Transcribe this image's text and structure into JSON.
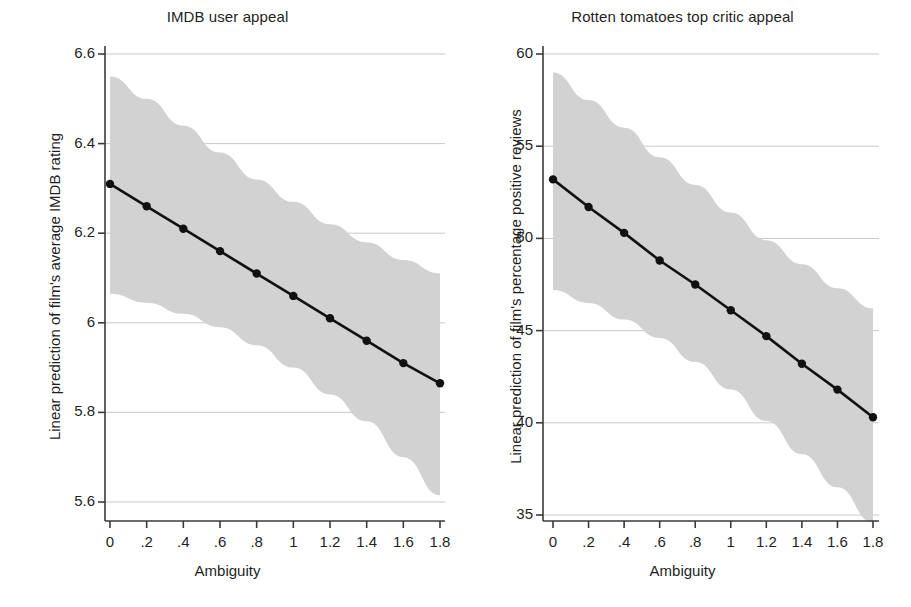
{
  "figure": {
    "width": 911,
    "height": 607,
    "background": "#ffffff",
    "panel_count": 2
  },
  "style": {
    "line_color": "#111111",
    "marker_color": "#111111",
    "band_color": "#d2d2d2",
    "grid_color": "#c9c9c9",
    "axis_color": "#3a3a3a",
    "text_color": "#1f1f1f"
  },
  "chart_data": [
    {
      "type": "line",
      "panel": "left",
      "title": "IMDB user appeal",
      "xlabel": "Ambiguity",
      "ylabel": "Linear prediction of film's average IMDB rating",
      "x": [
        0,
        0.2,
        0.4,
        0.6,
        0.8,
        1,
        1.2,
        1.4,
        1.6,
        1.8
      ],
      "values": [
        6.31,
        6.26,
        6.21,
        6.16,
        6.11,
        6.06,
        6.01,
        5.96,
        5.91,
        5.865
      ],
      "ci_upper": [
        6.55,
        6.5,
        6.44,
        6.38,
        6.32,
        6.27,
        6.22,
        6.18,
        6.14,
        6.11
      ],
      "ci_lower": [
        6.065,
        6.045,
        6.02,
        5.99,
        5.95,
        5.9,
        5.84,
        5.78,
        5.7,
        5.615
      ],
      "xlim": [
        0,
        1.8
      ],
      "ylim": [
        5.6,
        6.6
      ],
      "xticks": [
        0,
        0.2,
        0.4,
        0.6,
        0.8,
        1,
        1.2,
        1.4,
        1.6,
        1.8
      ],
      "xtick_labels": [
        "0",
        ".2",
        ".4",
        ".6",
        ".8",
        "1",
        "1.2",
        "1.4",
        "1.6",
        "1.8"
      ],
      "yticks": [
        5.6,
        5.8,
        6,
        6.2,
        6.4,
        6.6
      ],
      "ytick_labels": [
        "5.6",
        "5.8",
        "6",
        "6.2",
        "6.4",
        "6.6"
      ],
      "grid": "horizontal",
      "legend": "none",
      "band_label": "95% confidence interval"
    },
    {
      "type": "line",
      "panel": "right",
      "title": "Rotten tomatoes top critic appeal",
      "xlabel": "Ambiguity",
      "ylabel": "Linear prediction of film's percentage positive reviews",
      "x": [
        0,
        0.2,
        0.4,
        0.6,
        0.8,
        1,
        1.2,
        1.4,
        1.6,
        1.8
      ],
      "values": [
        53.2,
        51.7,
        50.3,
        48.8,
        47.5,
        46.1,
        44.7,
        43.2,
        41.8,
        40.3
      ],
      "ci_upper": [
        59.0,
        57.5,
        56.0,
        54.4,
        52.9,
        51.4,
        49.9,
        48.6,
        47.3,
        46.2
      ],
      "ci_lower": [
        47.2,
        46.5,
        45.6,
        44.6,
        43.3,
        41.8,
        40.1,
        38.3,
        36.5,
        34.6
      ],
      "xlim": [
        0,
        1.8
      ],
      "ylim": [
        35,
        60
      ],
      "xticks": [
        0,
        0.2,
        0.4,
        0.6,
        0.8,
        1,
        1.2,
        1.4,
        1.6,
        1.8
      ],
      "xtick_labels": [
        "0",
        ".2",
        ".4",
        ".6",
        ".8",
        "1",
        "1.2",
        "1.4",
        "1.6",
        "1.8"
      ],
      "yticks": [
        35,
        40,
        45,
        50,
        55,
        60
      ],
      "ytick_labels": [
        "35",
        "40",
        "45",
        "50",
        "55",
        "60"
      ],
      "grid": "horizontal",
      "legend": "none",
      "band_label": "95% confidence interval"
    }
  ]
}
